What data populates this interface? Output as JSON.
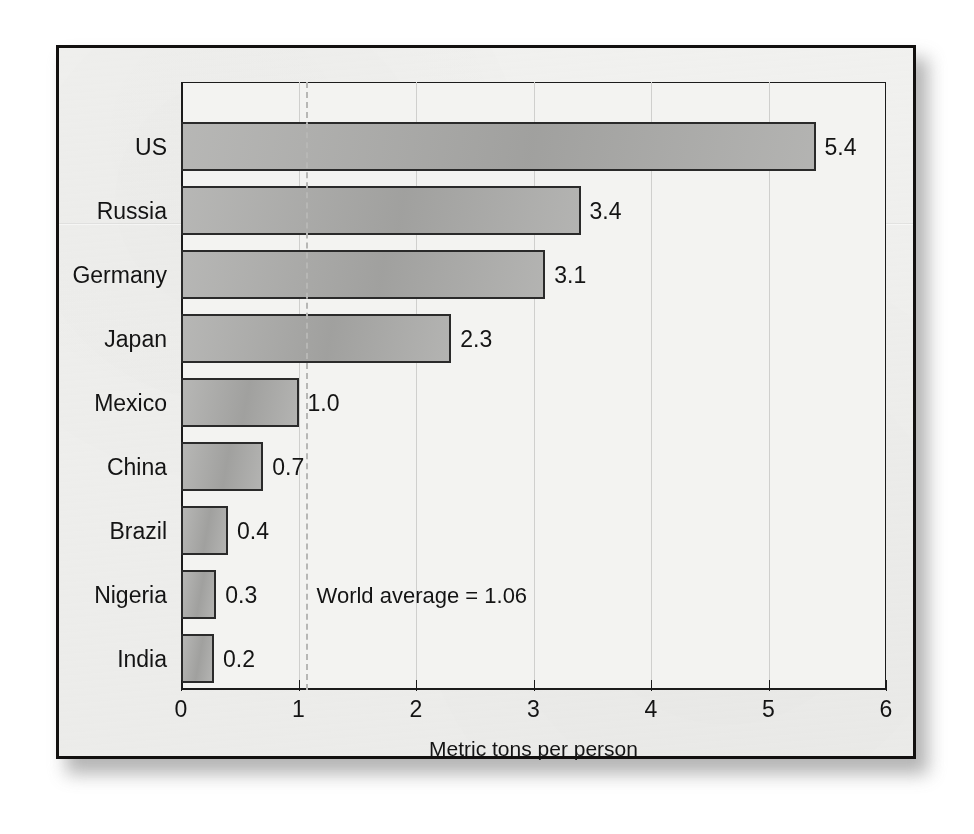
{
  "figure": {
    "background_color": "#f1f1ef",
    "bar_fill_color": "#a9a9a7",
    "bar_border_color": "#2a2a2a",
    "gridline_color": "#cfcfcd",
    "average_line_color": "#b7b7b5"
  },
  "chart_data": {
    "type": "bar",
    "orientation": "horizontal",
    "title": "",
    "xlabel": "Metric tons per person",
    "ylabel": "",
    "categories": [
      "US",
      "Russia",
      "Germany",
      "Japan",
      "Mexico",
      "China",
      "Brazil",
      "Nigeria",
      "India"
    ],
    "values": [
      5.4,
      3.4,
      3.1,
      2.3,
      1.0,
      0.7,
      0.4,
      0.3,
      0.2
    ],
    "value_labels": [
      "5.4",
      "3.4",
      "3.1",
      "2.3",
      "1.0",
      "0.7",
      "0.4",
      "0.3",
      "0.2"
    ],
    "xlim": [
      0,
      6
    ],
    "xticks": [
      0,
      1,
      2,
      3,
      4,
      5,
      6
    ],
    "xtick_labels": [
      "0",
      "1",
      "2",
      "3",
      "4",
      "5",
      "6"
    ],
    "grid": true,
    "legend": "none",
    "annotations": [
      {
        "text": "World average = 1.06",
        "value": 1.06,
        "style": "dashed-vertical-line"
      }
    ]
  }
}
